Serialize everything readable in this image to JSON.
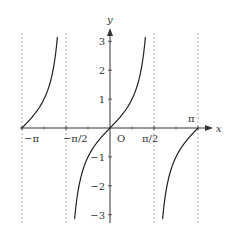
{
  "chart_data": {
    "type": "line",
    "title": "",
    "function": "y = tan x",
    "xlabel": "x",
    "ylabel": "y",
    "origin_label": "O",
    "xlim": [
      -3.14159,
      3.14159
    ],
    "ylim": [
      -3.15,
      3.15
    ],
    "x_ticks": [
      {
        "value": -3.14159,
        "label": "−π"
      },
      {
        "value": -1.5708,
        "label": "−π/2"
      },
      {
        "value": 1.5708,
        "label": "π/2"
      },
      {
        "value": 3.14159,
        "label": "π"
      }
    ],
    "y_ticks": [
      {
        "value": 3,
        "label": "3"
      },
      {
        "value": 2,
        "label": "2"
      },
      {
        "value": 1,
        "label": "1"
      },
      {
        "value": -1,
        "label": "−1"
      },
      {
        "value": -2,
        "label": "−2"
      },
      {
        "value": -3,
        "label": "−3"
      }
    ],
    "asymptotes": [
      -3.14159,
      -1.5708,
      1.5708,
      3.14159
    ],
    "series": [
      {
        "name": "tan x branch 1",
        "x_range": [
          -3.14159,
          -1.878
        ],
        "clip_y": 3.15
      },
      {
        "name": "tan x branch 2",
        "x_range": [
          -1.2637,
          1.2637
        ],
        "clip_y": 3.15
      },
      {
        "name": "tan x branch 3",
        "x_range": [
          1.878,
          3.14159
        ],
        "clip_y": 3.15
      }
    ],
    "grid": false,
    "legend": null
  },
  "colors": {
    "curve": "#222222",
    "axis": "#333333",
    "asymptote": "#999999"
  }
}
